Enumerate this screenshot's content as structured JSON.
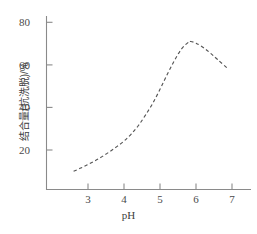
{
  "chart_data": {
    "type": "line",
    "title": "",
    "subtitle": "",
    "xlabel": "pH",
    "ylabel": "结合量(抗洗脱)/%",
    "xlim": [
      2.1,
      7.3
    ],
    "ylim": [
      4,
      84
    ],
    "xticks": [
      3,
      4,
      5,
      6,
      7
    ],
    "xtick_labels": [
      "3",
      "4",
      "5",
      "6",
      "7"
    ],
    "yticks": [
      20,
      40,
      60,
      80
    ],
    "ytick_labels": [
      "20",
      "40",
      "60",
      "80"
    ],
    "grid": false,
    "legend": null,
    "legend_position": "none",
    "series": [
      {
        "name": "结合量(抗洗脱)",
        "style": "dashed",
        "color": "#555555",
        "marker": "none",
        "x": [
          2.6,
          2.8,
          3.0,
          3.2,
          3.4,
          3.6,
          3.8,
          4.0,
          4.2,
          4.4,
          4.6,
          4.8,
          5.0,
          5.2,
          5.4,
          5.6,
          5.8,
          5.85,
          6.0,
          6.2,
          6.4,
          6.6,
          6.9
        ],
        "y": [
          10.0,
          11.5,
          13.2,
          15.0,
          17.0,
          19.2,
          21.6,
          24.2,
          27.5,
          31.5,
          36.5,
          42.0,
          48.5,
          55.5,
          62.0,
          67.5,
          70.8,
          71.0,
          70.2,
          68.2,
          65.5,
          62.5,
          58.0
        ]
      }
    ],
    "annotations": []
  },
  "axes": {
    "x_tick_values": [
      "3",
      "4",
      "5",
      "6",
      "7"
    ],
    "y_tick_values": [
      "80",
      "60",
      "40",
      "20"
    ],
    "x_title": "pH",
    "y_title": "结合量(抗洗脱)/%"
  },
  "style": {
    "background": "#ffffff",
    "axis_color": "#777777",
    "curve_color": "#555555",
    "text_color": "#3d3d3d"
  }
}
